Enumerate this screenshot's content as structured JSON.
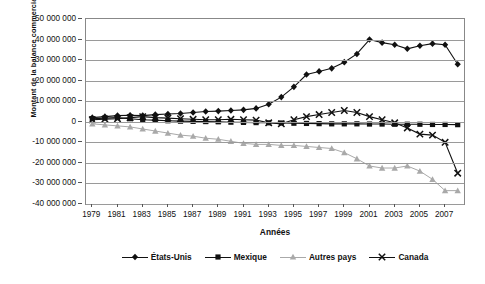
{
  "chart_data": {
    "type": "line",
    "title": "",
    "xlabel": "Années",
    "ylabel": "Montant de la balance commerciale",
    "xlim": [
      1978.5,
      2008.5
    ],
    "ylim": [
      -40000000,
      50000000
    ],
    "grid": true,
    "legend_position": "bottom",
    "ytick_labels": [
      "50 000 000",
      "40 000 000",
      "30 000 000",
      "20 000 000",
      "10 000 000",
      "0",
      "-10 000 000",
      "-20 000 000",
      "-30 000 000",
      "-40 000 000"
    ],
    "ytick_values": [
      50000000,
      40000000,
      30000000,
      20000000,
      10000000,
      0,
      -10000000,
      -20000000,
      -30000000,
      -40000000
    ],
    "xtick_labels": [
      "1979",
      "1981",
      "1983",
      "1985",
      "1987",
      "1989",
      "1991",
      "1993",
      "1995",
      "1997",
      "1999",
      "2001",
      "2003",
      "2005",
      "2007"
    ],
    "x": [
      1979,
      1980,
      1981,
      1982,
      1983,
      1984,
      1985,
      1986,
      1987,
      1988,
      1989,
      1990,
      1991,
      1992,
      1993,
      1994,
      1995,
      1996,
      1997,
      1998,
      1999,
      2000,
      2001,
      2002,
      2003,
      2004,
      2005,
      2006,
      2007,
      2008
    ],
    "series": [
      {
        "name": "États-Unis",
        "color": "#111111",
        "marker": "diamond",
        "values": [
          2000000,
          2500000,
          3000000,
          3200000,
          3000000,
          3500000,
          3800000,
          4000000,
          4500000,
          5000000,
          5200000,
          5500000,
          5800000,
          6500000,
          8500000,
          12000000,
          17000000,
          23000000,
          24500000,
          26000000,
          29000000,
          33000000,
          40000000,
          38500000,
          37500000,
          35500000,
          37000000,
          38000000,
          37500000,
          28000000
        ]
      },
      {
        "name": "Mexique",
        "color": "#111111",
        "marker": "square",
        "values": [
          1500000,
          1800000,
          2000000,
          1500000,
          1000000,
          800000,
          500000,
          300000,
          200000,
          100000,
          0,
          -200000,
          -300000,
          -400000,
          -500000,
          -600000,
          -700000,
          -800000,
          -900000,
          -1000000,
          -1000000,
          -1000000,
          -1100000,
          -1100000,
          -1200000,
          -1200000,
          -1200000,
          -1300000,
          -1300000,
          -1400000
        ]
      },
      {
        "name": "Autres pays",
        "color": "#a9a9a9",
        "marker": "triangle",
        "values": [
          -1000000,
          -1500000,
          -2000000,
          -2500000,
          -3500000,
          -4500000,
          -5500000,
          -6500000,
          -7000000,
          -8000000,
          -8500000,
          -9500000,
          -10500000,
          -11000000,
          -11000000,
          -11500000,
          -11500000,
          -12000000,
          -12500000,
          -13000000,
          -15000000,
          -18000000,
          -21500000,
          -22500000,
          -22500000,
          -21500000,
          -24000000,
          -28000000,
          -33500000,
          -33500000
        ]
      },
      {
        "name": "Canada",
        "color": "#111111",
        "marker": "cross",
        "values": [
          1000000,
          1300000,
          1500000,
          2000000,
          2500000,
          2000000,
          1800000,
          1500000,
          1200000,
          1000000,
          1000000,
          1200000,
          1000000,
          800000,
          -500000,
          -1000000,
          1000000,
          2500000,
          3500000,
          4500000,
          5500000,
          4500000,
          2500000,
          1000000,
          -500000,
          -3000000,
          -6000000,
          -6500000,
          -10000000,
          -25000000
        ]
      }
    ]
  }
}
